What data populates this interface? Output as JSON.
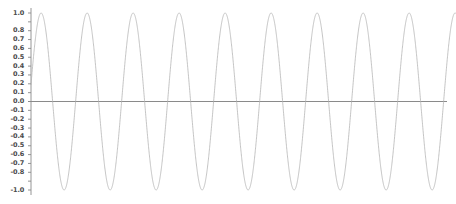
{
  "chart_data": {
    "type": "line",
    "title": "",
    "subtitle": "",
    "xlabel": "",
    "ylabel": "",
    "legend": [],
    "legend_position": "none",
    "grid": false,
    "background_color": "#ffffff",
    "line_color": "#b0b0b0",
    "axis_color": "#8a8a8a",
    "zero_line_color": "#8a8a8a",
    "tick_label_color": "#4a4a4a",
    "xlim": [
      0,
      9.15
    ],
    "ylim": [
      -1.0,
      1.0
    ],
    "x_tick_labels": [],
    "y_tick_labels": [
      "1.0",
      "0.8",
      "0.7",
      "0.6",
      "0.5",
      "0.4",
      "0.3",
      "0.2",
      "0.1",
      "0.0",
      "-0.1",
      "-0.2",
      "-0.3",
      "-0.4",
      "-0.5",
      "-0.6",
      "-0.7",
      "-0.8",
      "-1.0"
    ],
    "y_tick_values": [
      1.0,
      0.8,
      0.7,
      0.6,
      0.5,
      0.4,
      0.3,
      0.2,
      0.1,
      0.0,
      -0.1,
      -0.2,
      -0.3,
      -0.4,
      -0.5,
      -0.6,
      -0.7,
      -0.8,
      -1.0
    ],
    "y_tick_minor_values": [
      1.0,
      0.9,
      0.8,
      0.7,
      0.6,
      0.5,
      0.4,
      0.3,
      0.2,
      0.1,
      0.0,
      -0.1,
      -0.2,
      -0.3,
      -0.4,
      -0.5,
      -0.6,
      -0.7,
      -0.8,
      -0.9,
      -1.0
    ],
    "series": [
      {
        "name": "sine",
        "function": "sin",
        "amplitude": 1.0,
        "period_units": 1.0,
        "phase_offset_units": 0.22,
        "cycles_visible": 9,
        "peak_value": 1.0,
        "trough_value": -1.0,
        "peak_x_values": [
          0.22,
          1.22,
          2.22,
          3.22,
          4.22,
          5.22,
          6.22,
          7.22,
          8.22
        ],
        "trough_x_values": [
          0.72,
          1.72,
          2.72,
          3.72,
          4.72,
          5.72,
          6.72,
          7.72,
          8.72
        ]
      }
    ]
  }
}
